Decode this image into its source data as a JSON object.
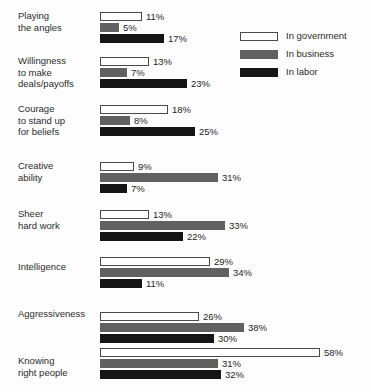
{
  "chart_data": {
    "type": "bar",
    "title": "",
    "subtitle": "",
    "xlabel": "",
    "ylabel": "",
    "orientation": "horizontal",
    "grid": false,
    "legend_position": "top-right",
    "axis_range": [
      0,
      58
    ],
    "value_suffix": "%",
    "categories": [
      "Playing\nthe angles",
      "Willingness\nto make\ndeals/payoffs",
      "Courage\nto stand up\nfor beliefs",
      "Creative\nability",
      "Sheer\nhard work",
      "Intelligence",
      "Aggressiveness",
      "Knowing\nright people"
    ],
    "series": [
      {
        "name": "In government",
        "color": "#ffffff",
        "values": [
          11,
          13,
          18,
          9,
          13,
          29,
          26,
          58
        ],
        "labels": [
          "11%",
          "13%",
          "18%",
          "9%",
          "13%",
          "29%",
          "26%",
          "58%"
        ]
      },
      {
        "name": "In business",
        "color": "#616161",
        "values": [
          5,
          7,
          8,
          31,
          33,
          34,
          38,
          31
        ],
        "labels": [
          "5%",
          "7%",
          "8%",
          "31%",
          "33%",
          "34%",
          "38%",
          "31%"
        ]
      },
      {
        "name": "In labor",
        "color": "#151515",
        "values": [
          17,
          23,
          25,
          7,
          22,
          11,
          30,
          32
        ],
        "labels": [
          "17%",
          "23%",
          "25%",
          "7%",
          "22%",
          "11%",
          "30%",
          "32%"
        ]
      }
    ]
  },
  "legend": {
    "items": [
      {
        "label": "In government",
        "swatch": "gov"
      },
      {
        "label": "In business",
        "swatch": "bus"
      },
      {
        "label": "In labor",
        "swatch": "lab"
      }
    ]
  }
}
